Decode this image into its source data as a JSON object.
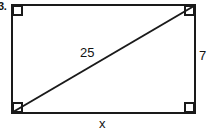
{
  "figure": {
    "kind": "rectangle-with-diagonal",
    "problem_number": "3.",
    "labels": {
      "diagonal": "25",
      "height": "7",
      "width": "x"
    },
    "colors": {
      "stroke": "#1a1a1a",
      "fill": "#ffffff",
      "background": "#ffffff",
      "text": "#121212"
    },
    "geometry": {
      "rect_left": 12,
      "rect_top": 5,
      "rect_right": 195,
      "rect_bottom": 113,
      "stroke_width": 2,
      "corner_marker_size": 9,
      "diagonal_from": "bottom-left",
      "diagonal_to": "top-right"
    },
    "right_angle_markers": [
      "top-left",
      "top-right",
      "bottom-left",
      "bottom-right"
    ]
  }
}
